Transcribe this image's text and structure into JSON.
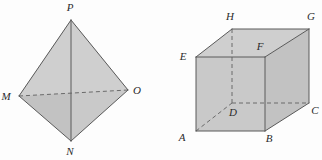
{
  "figure": {
    "background_color": "#fdfdfd",
    "face_fill_color": "#c9c9c9",
    "edge_color": "#5a5a5a",
    "hidden_edge_color": "#6a6a6a",
    "label_color": "#2b2b2b"
  },
  "shapes": [
    {
      "id": "tetrahedron",
      "name": "pyramid-MNOP",
      "type": "tetrahedron",
      "vertex_labels": [
        "P",
        "M",
        "O",
        "N"
      ],
      "vertices": [
        {
          "label": "P",
          "x": 71,
          "y": 20,
          "label_x": 70,
          "label_y": 11
        },
        {
          "label": "M",
          "x": 19,
          "y": 96,
          "label_x": 6,
          "label_y": 100
        },
        {
          "label": "O",
          "x": 128,
          "y": 90,
          "label_x": 134,
          "label_y": 94
        },
        {
          "label": "N",
          "x": 71,
          "y": 141,
          "label_x": 68,
          "label_y": 155
        }
      ],
      "visible_edges": [
        "P-M",
        "P-O",
        "P-N",
        "M-N",
        "N-O"
      ],
      "hidden_edges": [
        "M-O"
      ]
    },
    {
      "id": "cuboid",
      "name": "cuboid-ABCDEFGH",
      "type": "cuboid",
      "vertex_labels": [
        "A",
        "B",
        "C",
        "D",
        "E",
        "F",
        "G",
        "H"
      ],
      "vertices": [
        {
          "label": "A",
          "x": 196,
          "y": 131,
          "label_x": 181,
          "label_y": 140
        },
        {
          "label": "B",
          "x": 265,
          "y": 131,
          "label_x": 268,
          "label_y": 141
        },
        {
          "label": "C",
          "x": 309,
          "y": 103,
          "label_x": 312,
          "label_y": 113
        },
        {
          "label": "D",
          "x": 232,
          "y": 103,
          "label_x": 232,
          "label_y": 115
        },
        {
          "label": "E",
          "x": 196,
          "y": 57,
          "label_x": 182,
          "label_y": 58
        },
        {
          "label": "F",
          "x": 265,
          "y": 57,
          "label_x": 259,
          "label_y": 49
        },
        {
          "label": "G",
          "x": 309,
          "y": 29,
          "label_x": 309,
          "label_y": 19
        },
        {
          "label": "H",
          "x": 232,
          "y": 29,
          "label_x": 229,
          "label_y": 19
        }
      ],
      "visible_edges": [
        "A-B",
        "B-C",
        "A-E",
        "B-F",
        "C-G",
        "E-F",
        "F-G",
        "E-H",
        "H-G"
      ],
      "hidden_edges": [
        "A-D",
        "D-C",
        "D-H"
      ]
    }
  ]
}
